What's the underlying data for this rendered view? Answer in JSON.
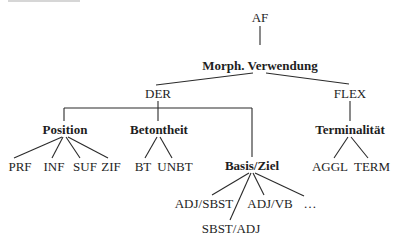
{
  "diagram": {
    "type": "tree",
    "root": "AF",
    "nodes": {
      "af": {
        "label": "AF",
        "bold": false
      },
      "morph": {
        "label": "Morph. Verwendung",
        "bold": true
      },
      "der": {
        "label": "DER",
        "bold": false
      },
      "flex": {
        "label": "FLEX",
        "bold": false
      },
      "position": {
        "label": "Position",
        "bold": true
      },
      "betontheit": {
        "label": "Betontheit",
        "bold": true
      },
      "basis_ziel": {
        "label": "Basis/Ziel",
        "bold": true
      },
      "terminalitaet": {
        "label": "Terminalität",
        "bold": true
      },
      "prf": {
        "label": "PRF",
        "bold": false
      },
      "inf": {
        "label": "INF",
        "bold": false
      },
      "suf": {
        "label": "SUF",
        "bold": false
      },
      "zif": {
        "label": "ZIF",
        "bold": false
      },
      "bt": {
        "label": "BT",
        "bold": false
      },
      "unbt": {
        "label": "UNBT",
        "bold": false
      },
      "adj_sbst": {
        "label": "ADJ/SBST",
        "bold": false
      },
      "sbst_adj": {
        "label": "SBST/ADJ",
        "bold": false
      },
      "adj_vb": {
        "label": "ADJ/VB",
        "bold": false
      },
      "ellipsis": {
        "label": "…",
        "bold": false
      },
      "aggl": {
        "label": "AGGL",
        "bold": false
      },
      "term": {
        "label": "TERM",
        "bold": false
      }
    },
    "edges": [
      [
        "AF",
        "Morph. Verwendung"
      ],
      [
        "Morph. Verwendung",
        "DER"
      ],
      [
        "Morph. Verwendung",
        "FLEX"
      ],
      [
        "DER",
        "Position"
      ],
      [
        "DER",
        "Betontheit"
      ],
      [
        "DER",
        "Basis/Ziel"
      ],
      [
        "FLEX",
        "Terminalität"
      ],
      [
        "Position",
        "PRF"
      ],
      [
        "Position",
        "INF"
      ],
      [
        "Position",
        "SUF"
      ],
      [
        "Position",
        "ZIF"
      ],
      [
        "Betontheit",
        "BT"
      ],
      [
        "Betontheit",
        "UNBT"
      ],
      [
        "Basis/Ziel",
        "ADJ/SBST"
      ],
      [
        "Basis/Ziel",
        "SBST/ADJ"
      ],
      [
        "Basis/Ziel",
        "ADJ/VB"
      ],
      [
        "Basis/Ziel",
        "…"
      ],
      [
        "Terminalität",
        "AGGL"
      ],
      [
        "Terminalität",
        "TERM"
      ]
    ]
  }
}
